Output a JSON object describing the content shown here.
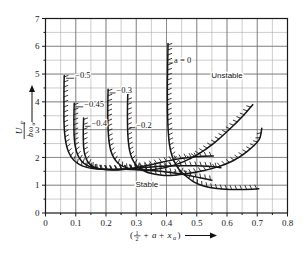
{
  "chart_data": {
    "type": "line",
    "title": "",
    "xlabel": "( 1/2 + a + x_alpha )",
    "ylabel": "U_F / (b omega_alpha)",
    "xlim": [
      0,
      0.8
    ],
    "ylim": [
      0,
      7
    ],
    "xticks": [
      "0",
      "0.1",
      "0.2",
      "0.3",
      "0.4",
      "0.5",
      "0.6",
      "0.7",
      "0.8"
    ],
    "ytick_values": [
      0,
      1,
      2,
      3,
      4,
      5,
      6,
      7
    ],
    "yticks": [
      "0",
      "1",
      "2",
      "3",
      "4",
      "5",
      "6",
      "7"
    ],
    "xtick_values": [
      0,
      0.1,
      0.2,
      0.3,
      0.4,
      0.5,
      0.6,
      0.7,
      0.8
    ],
    "grid": true,
    "minor_grid_step_x": 0.05,
    "minor_grid_step_y": 0.5,
    "legend_position": "inline-labels",
    "annotations": [
      {
        "name": "unstable-region-label",
        "text": "Unstable",
        "x": 0.6,
        "y": 4.85
      },
      {
        "name": "stable-region-label",
        "text": "Stable",
        "x": 0.335,
        "y": 0.93
      }
    ],
    "series": [
      {
        "name": "a = 0",
        "label": "a = 0",
        "label_x": 0.425,
        "label_y": 5.4,
        "hatch_side": "left-inside",
        "points": [
          [
            0.405,
            6.1
          ],
          [
            0.404,
            5.4
          ],
          [
            0.403,
            4.7
          ],
          [
            0.403,
            4.0
          ],
          [
            0.404,
            3.4
          ],
          [
            0.406,
            2.9
          ],
          [
            0.41,
            2.45
          ],
          [
            0.417,
            2.1
          ],
          [
            0.428,
            1.8
          ],
          [
            0.443,
            1.55
          ],
          [
            0.463,
            1.34
          ],
          [
            0.49,
            1.12
          ],
          [
            0.52,
            0.98
          ],
          [
            0.56,
            0.89
          ],
          [
            0.61,
            0.85
          ],
          [
            0.66,
            0.85
          ],
          [
            0.705,
            0.87
          ]
        ]
      },
      {
        "name": "a = -0.2",
        "label": "−0.2",
        "label_x": 0.3,
        "label_y": 3.07,
        "hatch_side": "left-inside",
        "points": [
          [
            0.272,
            4.32
          ],
          [
            0.271,
            3.8
          ],
          [
            0.271,
            3.3
          ],
          [
            0.272,
            2.85
          ],
          [
            0.275,
            2.45
          ],
          [
            0.281,
            2.12
          ],
          [
            0.291,
            1.86
          ],
          [
            0.305,
            1.66
          ],
          [
            0.325,
            1.52
          ],
          [
            0.35,
            1.42
          ],
          [
            0.385,
            1.36
          ],
          [
            0.425,
            1.36
          ],
          [
            0.47,
            1.42
          ],
          [
            0.52,
            1.52
          ],
          [
            0.57,
            1.66
          ],
          [
            0.62,
            1.88
          ],
          [
            0.665,
            2.2
          ],
          [
            0.705,
            2.62
          ],
          [
            0.715,
            3.05
          ]
        ]
      },
      {
        "name": "a = -0.3",
        "label": "−0.3",
        "label_x": 0.235,
        "label_y": 4.32,
        "hatch_side": "left-inside",
        "points": [
          [
            0.207,
            4.45
          ],
          [
            0.206,
            3.95
          ],
          [
            0.206,
            3.45
          ],
          [
            0.207,
            3.0
          ],
          [
            0.21,
            2.58
          ],
          [
            0.216,
            2.24
          ],
          [
            0.226,
            1.98
          ],
          [
            0.24,
            1.79
          ],
          [
            0.26,
            1.66
          ],
          [
            0.288,
            1.58
          ],
          [
            0.32,
            1.55
          ],
          [
            0.36,
            1.57
          ],
          [
            0.405,
            1.66
          ],
          [
            0.455,
            1.84
          ],
          [
            0.505,
            2.12
          ],
          [
            0.555,
            2.5
          ],
          [
            0.605,
            2.98
          ],
          [
            0.655,
            3.52
          ],
          [
            0.685,
            3.9
          ]
        ]
      },
      {
        "name": "a = -0.4",
        "label": "−0.4",
        "label_x": 0.152,
        "label_y": 3.12,
        "hatch_side": "left-inside",
        "points": [
          [
            0.126,
            3.42
          ],
          [
            0.125,
            3.05
          ],
          [
            0.125,
            2.7
          ],
          [
            0.126,
            2.38
          ],
          [
            0.13,
            2.1
          ],
          [
            0.138,
            1.88
          ],
          [
            0.15,
            1.72
          ],
          [
            0.168,
            1.62
          ],
          [
            0.192,
            1.57
          ],
          [
            0.222,
            1.55
          ],
          [
            0.258,
            1.57
          ],
          [
            0.298,
            1.63
          ],
          [
            0.34,
            1.72
          ],
          [
            0.385,
            1.83
          ],
          [
            0.43,
            1.93
          ],
          [
            0.475,
            2.0
          ],
          [
            0.52,
            2.04
          ],
          [
            0.555,
            2.05
          ]
        ]
      },
      {
        "name": "a = -0.45",
        "label": "−0.45",
        "label_x": 0.128,
        "label_y": 3.82,
        "hatch_side": "left-inside",
        "points": [
          [
            0.095,
            3.95
          ],
          [
            0.094,
            3.5
          ],
          [
            0.094,
            3.08
          ],
          [
            0.095,
            2.7
          ],
          [
            0.099,
            2.36
          ],
          [
            0.107,
            2.08
          ],
          [
            0.119,
            1.87
          ],
          [
            0.136,
            1.72
          ],
          [
            0.158,
            1.63
          ],
          [
            0.186,
            1.58
          ],
          [
            0.22,
            1.57
          ],
          [
            0.26,
            1.58
          ],
          [
            0.305,
            1.62
          ],
          [
            0.352,
            1.66
          ],
          [
            0.4,
            1.69
          ],
          [
            0.45,
            1.7
          ],
          [
            0.5,
            1.7
          ],
          [
            0.545,
            1.67
          ],
          [
            0.58,
            1.63
          ]
        ]
      },
      {
        "name": "a = -0.5",
        "label": "−0.5",
        "label_x": 0.098,
        "label_y": 4.85,
        "hatch_side": "left-inside",
        "points": [
          [
            0.062,
            4.95
          ],
          [
            0.061,
            4.4
          ],
          [
            0.061,
            3.85
          ],
          [
            0.061,
            3.35
          ],
          [
            0.063,
            2.9
          ],
          [
            0.068,
            2.5
          ],
          [
            0.077,
            2.18
          ],
          [
            0.091,
            1.93
          ],
          [
            0.11,
            1.76
          ],
          [
            0.134,
            1.65
          ],
          [
            0.163,
            1.59
          ],
          [
            0.197,
            1.57
          ],
          [
            0.236,
            1.57
          ],
          [
            0.28,
            1.57
          ],
          [
            0.325,
            1.55
          ],
          [
            0.372,
            1.51
          ],
          [
            0.418,
            1.45
          ],
          [
            0.465,
            1.37
          ],
          [
            0.51,
            1.27
          ],
          [
            0.55,
            1.18
          ]
        ]
      }
    ]
  },
  "axis": {
    "y_label_numerator": "U",
    "y_label_num_sub": "F",
    "y_label_denominator_b": "b",
    "y_label_denominator_w": "ω",
    "y_label_den_sub": "α",
    "x_label_open": "(",
    "x_label_half_num": "1",
    "x_label_half_den": "2",
    "x_label_plus1": "+",
    "x_label_a": "a",
    "x_label_plus2": "+",
    "x_label_x": "x",
    "x_label_x_sub": "α",
    "x_label_close": ")"
  },
  "colors": {
    "grid": "#8d8d8d",
    "axis": "#1a1a1a",
    "curve": "#151515",
    "background": "#ffffff"
  }
}
